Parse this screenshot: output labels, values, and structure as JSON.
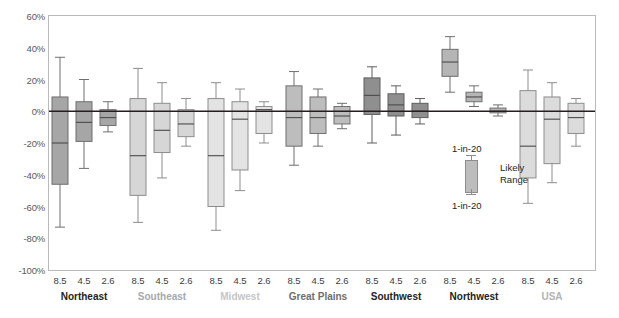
{
  "chart_data": {
    "type": "box",
    "title": "",
    "xlabel": "",
    "ylabel": "",
    "ylim": [
      -100,
      60
    ],
    "grid": false,
    "yticks": [
      "60%",
      "40%",
      "20%",
      "0%",
      "-20%",
      "-40%",
      "-60%",
      "-80%",
      "-100%"
    ],
    "ytick_values": [
      60,
      40,
      20,
      0,
      -20,
      -40,
      -60,
      -80,
      -100
    ],
    "scenario_labels": [
      "8.5",
      "4.5",
      "2.6"
    ],
    "legend": {
      "top_label": "1-in-20",
      "bottom_label": "1-in-20",
      "middle_label_line1": "Likely",
      "middle_label_line2": "Range"
    },
    "groups": [
      {
        "name": "Northeast",
        "label_color": "#231f20",
        "fill": "#a6a6a6",
        "stroke": "#6f6f6f",
        "boxes": [
          {
            "scenario": "8.5",
            "low": -73,
            "q1": -46,
            "median": -20,
            "q3": 9,
            "high": 34
          },
          {
            "scenario": "4.5",
            "low": -36,
            "q1": -19,
            "median": -7,
            "q3": 6,
            "high": 20
          },
          {
            "scenario": "2.6",
            "low": -13,
            "q1": -9,
            "median": -4,
            "q3": 1,
            "high": 6
          }
        ]
      },
      {
        "name": "Southeast",
        "label_color": "#a7a9ac",
        "fill": "#d6d6d6",
        "stroke": "#8d8d8d",
        "boxes": [
          {
            "scenario": "8.5",
            "low": -70,
            "q1": -53,
            "median": -28,
            "q3": 8,
            "high": 27
          },
          {
            "scenario": "4.5",
            "low": -42,
            "q1": -26,
            "median": -12,
            "q3": 5,
            "high": 18
          },
          {
            "scenario": "2.6",
            "low": -22,
            "q1": -16,
            "median": -8,
            "q3": 1,
            "high": 8
          }
        ]
      },
      {
        "name": "Midwest",
        "label_color": "#c4c6c8",
        "fill": "#e3e3e3",
        "stroke": "#8d8d8d",
        "boxes": [
          {
            "scenario": "8.5",
            "low": -75,
            "q1": -60,
            "median": -28,
            "q3": 8,
            "high": 18
          },
          {
            "scenario": "4.5",
            "low": -50,
            "q1": -37,
            "median": -5,
            "q3": 6,
            "high": 14
          },
          {
            "scenario": "2.6",
            "low": -20,
            "q1": -14,
            "median": 1,
            "q3": 3,
            "high": 6
          }
        ]
      },
      {
        "name": "Great Plains",
        "label_color": "#6d6e71",
        "fill": "#bdbdbd",
        "stroke": "#6f6f6f",
        "boxes": [
          {
            "scenario": "8.5",
            "low": -34,
            "q1": -22,
            "median": -4,
            "q3": 16,
            "high": 25
          },
          {
            "scenario": "4.5",
            "low": -22,
            "q1": -14,
            "median": -4,
            "q3": 9,
            "high": 14
          },
          {
            "scenario": "2.6",
            "low": -11,
            "q1": -8,
            "median": -3,
            "q3": 3,
            "high": 5
          }
        ]
      },
      {
        "name": "Southwest",
        "label_color": "#231f20",
        "fill": "#8f8f8f",
        "stroke": "#5e5e5e",
        "boxes": [
          {
            "scenario": "8.5",
            "low": -20,
            "q1": -2,
            "median": 10,
            "q3": 21,
            "high": 28
          },
          {
            "scenario": "4.5",
            "low": -15,
            "q1": -3,
            "median": 4,
            "q3": 11,
            "high": 16
          },
          {
            "scenario": "2.6",
            "low": -8,
            "q1": -4,
            "median": 0,
            "q3": 5,
            "high": 8
          }
        ]
      },
      {
        "name": "Northwest",
        "label_color": "#231f20",
        "fill": "#b5b5b5",
        "stroke": "#6f6f6f",
        "boxes": [
          {
            "scenario": "8.5",
            "low": 12,
            "q1": 22,
            "median": 31,
            "q3": 39,
            "high": 47
          },
          {
            "scenario": "4.5",
            "low": 3,
            "q1": 6,
            "median": 9,
            "q3": 12,
            "high": 16
          },
          {
            "scenario": "2.6",
            "low": -3,
            "q1": -1,
            "median": 0,
            "q3": 2,
            "high": 4
          }
        ]
      },
      {
        "name": "USA",
        "label_color": "#b2b4b7",
        "fill": "#dcdcdc",
        "stroke": "#8d8d8d",
        "boxes": [
          {
            "scenario": "8.5",
            "low": -58,
            "q1": -42,
            "median": -22,
            "q3": 13,
            "high": 26
          },
          {
            "scenario": "4.5",
            "low": -45,
            "q1": -33,
            "median": -5,
            "q3": 9,
            "high": 18
          },
          {
            "scenario": "2.6",
            "low": -22,
            "q1": -14,
            "median": -4,
            "q3": 5,
            "high": 8
          }
        ]
      }
    ]
  }
}
